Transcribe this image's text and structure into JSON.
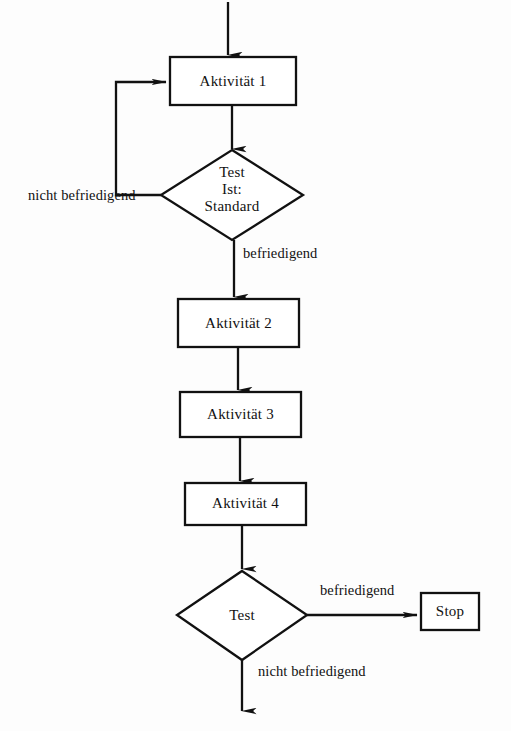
{
  "diagram": {
    "type": "flowchart",
    "language": "de",
    "background_color": "#fdfdfd",
    "stroke_color": "#111111",
    "nodes": [
      {
        "id": "aktivitaet1",
        "shape": "rectangle",
        "label": "Aktivität 1",
        "x": 170,
        "y": 57,
        "w": 126,
        "h": 48
      },
      {
        "id": "test1",
        "shape": "diamond",
        "label_line1": "Test",
        "label_line2": "Ist:",
        "label_line3": "Standard",
        "cx": 232,
        "cy": 195,
        "w": 142,
        "h": 90
      },
      {
        "id": "aktivitaet2",
        "shape": "rectangle",
        "label": "Aktivität 2",
        "x": 178,
        "y": 299,
        "w": 121,
        "h": 48
      },
      {
        "id": "aktivitaet3",
        "shape": "rectangle",
        "label": "Aktivität 3",
        "x": 180,
        "y": 392,
        "w": 121,
        "h": 45
      },
      {
        "id": "aktivitaet4",
        "shape": "rectangle",
        "label": "Aktivität 4",
        "x": 185,
        "y": 483,
        "w": 121,
        "h": 42
      },
      {
        "id": "test2",
        "shape": "diamond",
        "label": "Test",
        "cx": 242,
        "cy": 615,
        "w": 130,
        "h": 89
      },
      {
        "id": "stop",
        "shape": "rectangle",
        "label": "Stop",
        "x": 421,
        "y": 593,
        "w": 58,
        "h": 37
      }
    ],
    "edge_labels": {
      "loop_back": "nicht befriedigend",
      "test1_pass": "befriedigend",
      "test2_pass": "befriedigend",
      "test2_fail": "nicht befriedigend"
    }
  }
}
